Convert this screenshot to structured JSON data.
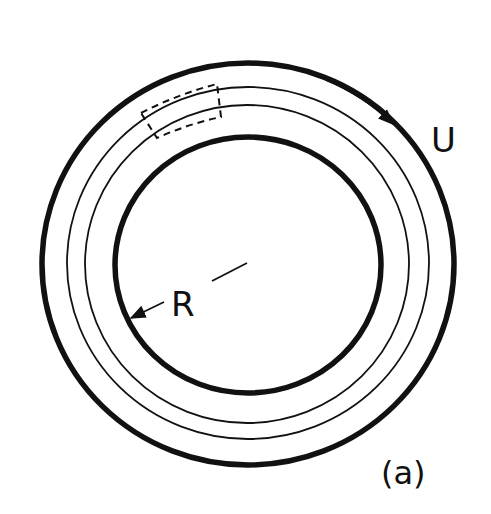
{
  "figure": {
    "panel_label": "(a)",
    "labels": {
      "velocity": "U",
      "radius": "R"
    },
    "colors": {
      "ink": "#111111",
      "background": "#ffffff"
    }
  }
}
